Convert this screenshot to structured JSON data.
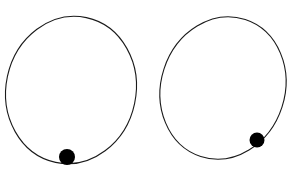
{
  "diagram": {
    "background": "#ffffff",
    "stroke_color": "#1a1a1a",
    "ball_color": "#000000",
    "panels": [
      {
        "name": "left-orbit",
        "ellipse": {
          "cx": 71,
          "cy": 90,
          "rx": 65,
          "ry": 74,
          "rotate": 12
        },
        "ball": {
          "cx": 67,
          "cy": 157,
          "r": 8
        }
      },
      {
        "name": "right-orbit",
        "ellipse": {
          "cx": 223,
          "cy": 88,
          "rx": 62,
          "ry": 72,
          "rotate": 18
        },
        "ball": {
          "cx": 257,
          "cy": 140,
          "r": 7.5
        }
      }
    ]
  }
}
